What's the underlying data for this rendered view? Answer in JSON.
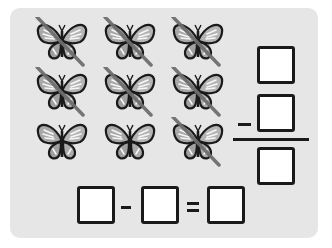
{
  "worksheet": {
    "background_color": "#e6e6e6",
    "butterflies": [
      {
        "row": 1,
        "col": 1,
        "crossed": true
      },
      {
        "row": 1,
        "col": 2,
        "crossed": true
      },
      {
        "row": 1,
        "col": 3,
        "crossed": true
      },
      {
        "row": 2,
        "col": 1,
        "crossed": true
      },
      {
        "row": 2,
        "col": 2,
        "crossed": true
      },
      {
        "row": 2,
        "col": 3,
        "crossed": true
      },
      {
        "row": 3,
        "col": 1,
        "crossed": false
      },
      {
        "row": 3,
        "col": 2,
        "crossed": false
      },
      {
        "row": 3,
        "col": 3,
        "crossed": true
      }
    ],
    "butterfly_total": 9,
    "crossed_count": 7,
    "horizontal_equation": {
      "operand1": "",
      "operator": "−",
      "operand2": "",
      "equals": "=",
      "result": ""
    },
    "vertical_equation": {
      "top": "",
      "operator": "−",
      "middle": "",
      "result": ""
    }
  }
}
